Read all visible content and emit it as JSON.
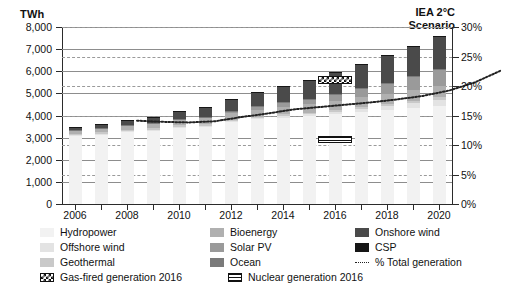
{
  "chart_data": {
    "type": "bar",
    "title": "",
    "subtitle": "",
    "xlabel": "",
    "ylabel": "TWh",
    "y2label": "",
    "ylim": [
      0,
      8000
    ],
    "y2lim": [
      0,
      30
    ],
    "grid": true,
    "legend_position": "bottom",
    "stacked": true,
    "x": [
      2006,
      2007,
      2008,
      2009,
      2010,
      2011,
      2012,
      2013,
      2014,
      2015,
      2016,
      2017,
      2018,
      2019,
      2020
    ],
    "categories": [
      "2006",
      "2007",
      "2008",
      "2009",
      "2010",
      "2011",
      "2012",
      "2013",
      "2014",
      "2015",
      "2016",
      "2017",
      "2018",
      "2019",
      "2020"
    ],
    "xtick_labels": [
      "2006",
      "2008",
      "2010",
      "2012",
      "2014",
      "2016",
      "2018",
      "2020"
    ],
    "ytick_labels": [
      "0",
      "1,000",
      "2,000",
      "3,000",
      "4,000",
      "5,000",
      "6,000",
      "7,000",
      "8,000"
    ],
    "ytick_values": [
      0,
      1000,
      2000,
      3000,
      4000,
      5000,
      6000,
      7000,
      8000
    ],
    "y2tick_labels": [
      "0%",
      "5%",
      "10%",
      "15%",
      "20%",
      "25%",
      "30%"
    ],
    "y2tick_values": [
      0,
      5,
      10,
      15,
      20,
      25,
      30
    ],
    "series": [
      {
        "name": "Hydropower",
        "color": "#f2f2f2",
        "values": [
          3120,
          3180,
          3270,
          3340,
          3480,
          3520,
          3700,
          3820,
          3900,
          3960,
          4050,
          4140,
          4230,
          4320,
          4420
        ]
      },
      {
        "name": "Offshore wind",
        "color": "#e3e3e3",
        "values": [
          3,
          5,
          8,
          12,
          18,
          26,
          38,
          52,
          70,
          92,
          120,
          155,
          195,
          245,
          300
        ]
      },
      {
        "name": "Geothermal",
        "color": "#c9c9c9",
        "values": [
          59,
          61,
          64,
          67,
          70,
          72,
          75,
          78,
          80,
          82,
          85,
          88,
          91,
          94,
          98
        ]
      },
      {
        "name": "Bioenergy",
        "color": "#b0b0b0",
        "values": [
          170,
          185,
          200,
          215,
          235,
          255,
          290,
          320,
          350,
          380,
          410,
          440,
          470,
          500,
          535
        ]
      },
      {
        "name": "Solar PV",
        "color": "#9a9a9a",
        "values": [
          6,
          9,
          14,
          23,
          35,
          65,
          100,
          140,
          190,
          250,
          320,
          400,
          500,
          620,
          760
        ]
      },
      {
        "name": "Ocean",
        "color": "#7a7a7a",
        "values": [
          1,
          1,
          1,
          1,
          1,
          1,
          1,
          1,
          1,
          1,
          1,
          1,
          2,
          2,
          3
        ]
      },
      {
        "name": "Onshore wind",
        "color": "#4a4a4a",
        "values": [
          130,
          175,
          230,
          290,
          350,
          430,
          530,
          640,
          740,
          840,
          960,
          1090,
          1220,
          1340,
          1460
        ]
      },
      {
        "name": "CSP",
        "color": "#161616",
        "values": [
          1,
          1,
          1,
          2,
          2,
          3,
          5,
          6,
          8,
          10,
          12,
          14,
          17,
          22,
          28
        ]
      }
    ],
    "line_series": {
      "name": "% Total generation",
      "style": "dotted",
      "color": "#222222",
      "axis": "right",
      "values": [
        18.7,
        18.5,
        18.4,
        18.6,
        19.3,
        19.9,
        20.6,
        21.0,
        21.4,
        21.8,
        22.3,
        22.9,
        23.8,
        25.2,
        27.2
      ]
    },
    "annotations": [
      {
        "name": "iea-scenario-label",
        "text_line_1": "IEA 2°C",
        "text_line_2": "Scenario"
      },
      {
        "name": "gas-fired-marker",
        "label": "Gas-fired generation 2016",
        "value": 5600
      },
      {
        "name": "nuclear-marker",
        "label": "Nuclear generation 2016",
        "value": 2900
      }
    ]
  },
  "axes": {
    "y_unit": "TWh",
    "y_left_ticks": [
      "8,000",
      "7,000",
      "6,000",
      "5,000",
      "4,000",
      "3,000",
      "2,000",
      "1,000",
      "0"
    ],
    "y_right_ticks": [
      "30%",
      "25%",
      "20%",
      "15%",
      "10%",
      "5%",
      "0%"
    ],
    "x_ticks": [
      "2006",
      "2008",
      "2010",
      "2012",
      "2014",
      "2016",
      "2018",
      "2020"
    ]
  },
  "annotation": {
    "scenario_line1": "IEA 2°C",
    "scenario_line2": "Scenario"
  },
  "legend": {
    "column1": [
      {
        "label": "Hydropower",
        "swatch": "#f2f2f2",
        "kind": "box"
      },
      {
        "label": "Offshore wind",
        "swatch": "#e3e3e3",
        "kind": "box"
      },
      {
        "label": "Geothermal",
        "swatch": "#c9c9c9",
        "kind": "box"
      },
      {
        "label": "Gas-fired generation 2016",
        "swatch": "#ffffff",
        "kind": "checker"
      }
    ],
    "column2": [
      {
        "label": "Bioenergy",
        "swatch": "#b0b0b0",
        "kind": "box"
      },
      {
        "label": "Solar PV",
        "swatch": "#9a9a9a",
        "kind": "box"
      },
      {
        "label": "Ocean",
        "swatch": "#7a7a7a",
        "kind": "box"
      },
      {
        "label": "Nuclear generation 2016",
        "swatch": "#ffffff",
        "kind": "stripe"
      }
    ],
    "column3": [
      {
        "label": "Onshore wind",
        "swatch": "#4a4a4a",
        "kind": "box"
      },
      {
        "label": "CSP",
        "swatch": "#161616",
        "kind": "box"
      },
      {
        "label": "% Total generation",
        "swatch": "#222222",
        "kind": "dotted-line"
      }
    ]
  }
}
